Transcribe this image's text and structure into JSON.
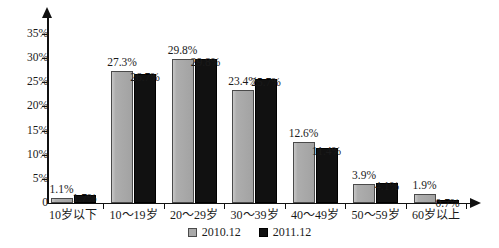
{
  "chart_data": {
    "type": "bar",
    "title": "",
    "subtitle": "",
    "xlabel": "",
    "ylabel": "",
    "grid": false,
    "legend_position": "bottom-center",
    "ylim": [
      0,
      35
    ],
    "ytick_values": [
      0,
      5,
      10,
      15,
      20,
      25,
      30,
      35
    ],
    "ytick_labels": [
      "0",
      "5%",
      "10%",
      "15%",
      "20%",
      "25%",
      "30%",
      "35%"
    ],
    "categories": [
      "10岁以下",
      "10～19岁",
      "20～29岁",
      "30～39岁",
      "40～49岁",
      "50～59岁",
      "60岁以上"
    ],
    "series": [
      {
        "name": "2010.12",
        "color": "#a9a9a9",
        "values": [
          1.1,
          27.3,
          29.8,
          23.4,
          12.6,
          3.9,
          1.9
        ],
        "labels": [
          "1.1%",
          "27.3%",
          "29.8%",
          "23.4%",
          "12.6%",
          "3.9%",
          "1.9%"
        ]
      },
      {
        "name": "2011.12",
        "color": "#111111",
        "values": [
          1.7,
          26.7,
          29.8,
          25.7,
          11.4,
          4.1,
          0.7
        ],
        "labels": [
          "1.7%",
          "26.7%",
          "29.8%",
          "25.7%",
          "11.4%",
          "4.1%",
          "0.7%"
        ]
      }
    ]
  },
  "legend": {
    "items": [
      {
        "label": "2010.12",
        "swatch": "series-a"
      },
      {
        "label": "2011.12",
        "swatch": "series-b"
      }
    ]
  }
}
